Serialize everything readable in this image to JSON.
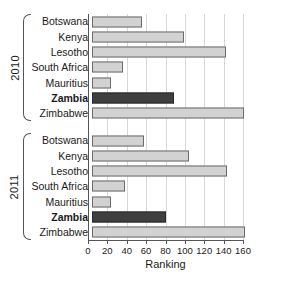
{
  "chart_data": {
    "type": "bar",
    "orientation": "horizontal",
    "title": "",
    "xlabel": "Ranking",
    "ylabel": "",
    "xlim": [
      0,
      160
    ],
    "xticks": [
      0,
      20,
      40,
      60,
      80,
      100,
      120,
      140,
      160
    ],
    "grid": true,
    "legend": false,
    "colors": {
      "default_bar": "#d2d2d2",
      "highlight_bar": "#3f3f3f",
      "bar_border": "#6b6b6b",
      "axis": "#555555",
      "gridline": "#d8d8d8",
      "text": "#1a1a1a"
    },
    "highlight_category": "Zambia",
    "categories": [
      "Botswana",
      "Kenya",
      "Lesotho",
      "South Africa",
      "Mauritius",
      "Zambia",
      "Zimbabwe"
    ],
    "groups": [
      {
        "label": "2010",
        "values": [
          52,
          95,
          138,
          32,
          20,
          85,
          157
        ]
      },
      {
        "label": "2011",
        "values": [
          54,
          100,
          139,
          34,
          20,
          76,
          158
        ]
      }
    ]
  }
}
